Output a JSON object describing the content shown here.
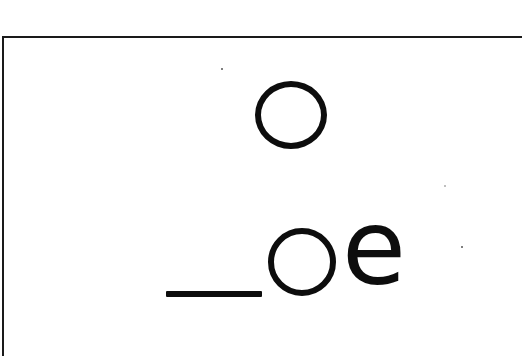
{
  "card": {
    "target_letter": "o",
    "pattern": {
      "blank": "_",
      "vowel": "o",
      "ending": "e",
      "full": "_oe"
    }
  },
  "colors": {
    "ink": "#0d0d0d",
    "border": "#1a1a1a",
    "paper": "#ffffff"
  }
}
